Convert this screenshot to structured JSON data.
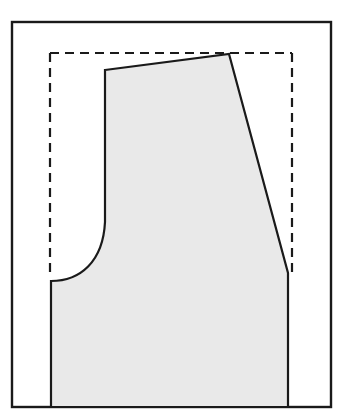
{
  "figure": {
    "canvas": {
      "width": 344,
      "height": 420,
      "background": "#ffffff"
    }
  },
  "colors": {
    "frame_stroke": "#1a1a1a",
    "dashed_stroke": "#1a1a1a",
    "shape_stroke": "#1a1a1a",
    "shape_fill": "#e9e9e9",
    "background": "#ffffff"
  },
  "frame": {
    "name": "outer-frame",
    "x": 12,
    "y": 22,
    "width": 319,
    "height": 385,
    "stroke_width": 2.4,
    "fill": "none"
  },
  "construction_rect": {
    "name": "dashed-construction-rectangle",
    "left": 50,
    "top": 53,
    "right": 292,
    "bottom": 278,
    "stroke_width": 2.2,
    "dash_length": 9,
    "gap_length": 6,
    "closed_bottom": false,
    "sides_drawn": [
      "left",
      "top",
      "right"
    ]
  },
  "pattern_shape": {
    "name": "pattern-piece-outline",
    "stroke_width": 2.2,
    "fill": "#e9e9e9",
    "vertices": [
      {
        "label": "shoulder-inner-top",
        "x": 105,
        "y": 70
      },
      {
        "label": "shoulder-outer-apex",
        "x": 229,
        "y": 54
      },
      {
        "label": "side-seam-break",
        "x": 288,
        "y": 273
      },
      {
        "label": "hem-right",
        "x": 288,
        "y": 407
      },
      {
        "label": "hem-left",
        "x": 51,
        "y": 407
      },
      {
        "label": "underarm-left",
        "x": 51,
        "y": 281
      },
      {
        "label": "armhole-curve-start",
        "x": 105,
        "y": 222
      }
    ],
    "armhole_curve": {
      "type": "cubic-bezier",
      "from": {
        "x": 105,
        "y": 222
      },
      "control1": {
        "x": 103,
        "y": 262
      },
      "control2": {
        "x": 80,
        "y": 281
      },
      "to": {
        "x": 51,
        "y": 281
      }
    },
    "edges": [
      {
        "name": "center-front-upper",
        "type": "line",
        "from": "shoulder-inner-top",
        "to": "armhole-curve-start"
      },
      {
        "name": "shoulder-seam",
        "type": "line",
        "from": "shoulder-inner-top",
        "to": "shoulder-outer-apex"
      },
      {
        "name": "side-seam-slant",
        "type": "line",
        "from": "shoulder-outer-apex",
        "to": "side-seam-break"
      },
      {
        "name": "side-seam-lower",
        "type": "line",
        "from": "side-seam-break",
        "to": "hem-right"
      },
      {
        "name": "hem-line",
        "type": "line",
        "from": "hem-right",
        "to": "hem-left"
      },
      {
        "name": "center-back-lower",
        "type": "line",
        "from": "hem-left",
        "to": "underarm-left"
      },
      {
        "name": "armhole-curve",
        "type": "curve",
        "from": "underarm-left",
        "to": "armhole-curve-start"
      }
    ]
  }
}
